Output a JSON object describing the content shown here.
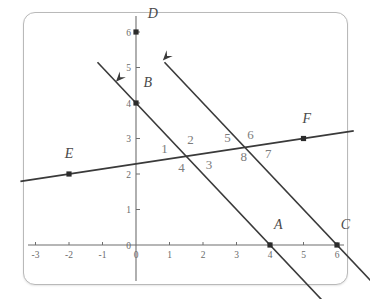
{
  "figure": {
    "panel_border_color": "#b9b9b9",
    "background_color": "#ffffff",
    "line_color": "#3a3a3a",
    "axis_color": "#6e6e6e",
    "label_color": "#4a4a4a",
    "angle_label_color": "#7c7c7c"
  },
  "chart_data": {
    "type": "scatter",
    "title": "",
    "xlabel": "",
    "ylabel": "",
    "xlim": [
      -3.4,
      6.4
    ],
    "ylim": [
      -0.5,
      6.6
    ],
    "grid": false,
    "legend": "none",
    "x_ticks": [
      -3,
      -2,
      -1,
      0,
      1,
      2,
      3,
      4,
      5,
      6
    ],
    "x_tick_labels": [
      "-3",
      "-2",
      "-1",
      "0",
      "1",
      "2",
      "3",
      "4",
      "5",
      "6"
    ],
    "y_ticks": [
      0,
      1,
      2,
      3,
      4,
      5,
      6
    ],
    "y_tick_labels": [
      "0",
      "1",
      "2",
      "3",
      "4",
      "5",
      "6"
    ],
    "origin_label": "0",
    "points": [
      {
        "name": "A",
        "label": "A",
        "x": 4,
        "y": 0,
        "label_dx": 0.25,
        "label_dy": 0.55
      },
      {
        "name": "B",
        "label": "B",
        "x": 0,
        "y": 4,
        "label_dx": 0.35,
        "label_dy": 0.55
      },
      {
        "name": "C",
        "label": "C",
        "x": 6,
        "y": 0,
        "label_dx": 0.25,
        "label_dy": 0.55
      },
      {
        "name": "D",
        "label": "D",
        "x": 0,
        "y": 6,
        "label_dx": 0.5,
        "label_dy": 0.5
      },
      {
        "name": "E",
        "label": "E",
        "x": -2,
        "y": 2,
        "label_dx": 0.0,
        "label_dy": 0.55
      },
      {
        "name": "F",
        "label": "F",
        "x": 5,
        "y": 3,
        "label_dx": 0.1,
        "label_dy": 0.55
      }
    ],
    "lines": [
      {
        "name": "line-BA",
        "through": [
          "B",
          "A"
        ],
        "slope": -1,
        "intercept": 4,
        "x_start": -1.15,
        "x_end": 5.6,
        "arrow_at": "start",
        "arrow_x": -0.6,
        "arrow_y": 4.6
      },
      {
        "name": "line-DC",
        "through": [
          "D",
          "C"
        ],
        "slope": -1,
        "intercept": 6,
        "x_start": 0.85,
        "x_end": 7.0,
        "arrow_at": "start",
        "arrow_x": 0.8,
        "arrow_y": 5.2
      },
      {
        "name": "transversal-EF",
        "through": [
          "E",
          "F"
        ],
        "slope": 0.142857,
        "intercept": 2.285714,
        "x_start": -3.45,
        "x_end": 6.5,
        "arrow_at": "none",
        "arrow_x": null,
        "arrow_y": null
      }
    ],
    "intersections": [
      {
        "name": "intersection-1",
        "x": 1.5,
        "y": 2.5,
        "lines": [
          "line-BA",
          "transversal-EF"
        ]
      },
      {
        "name": "intersection-2",
        "x": 3.25,
        "y": 2.75,
        "lines": [
          "line-DC",
          "transversal-EF"
        ]
      }
    ],
    "angle_labels": [
      {
        "id": "1",
        "text": "1",
        "x": 0.85,
        "y": 2.72
      },
      {
        "id": "2",
        "text": "2",
        "x": 1.63,
        "y": 2.98
      },
      {
        "id": "3",
        "text": "3",
        "x": 2.18,
        "y": 2.28
      },
      {
        "id": "4",
        "text": "4",
        "x": 1.36,
        "y": 2.18
      },
      {
        "id": "5",
        "text": "5",
        "x": 2.73,
        "y": 3.04
      },
      {
        "id": "6",
        "text": "6",
        "x": 3.42,
        "y": 3.1
      },
      {
        "id": "7",
        "text": "7",
        "x": 3.95,
        "y": 2.58
      },
      {
        "id": "8",
        "text": "8",
        "x": 3.22,
        "y": 2.5
      }
    ]
  }
}
